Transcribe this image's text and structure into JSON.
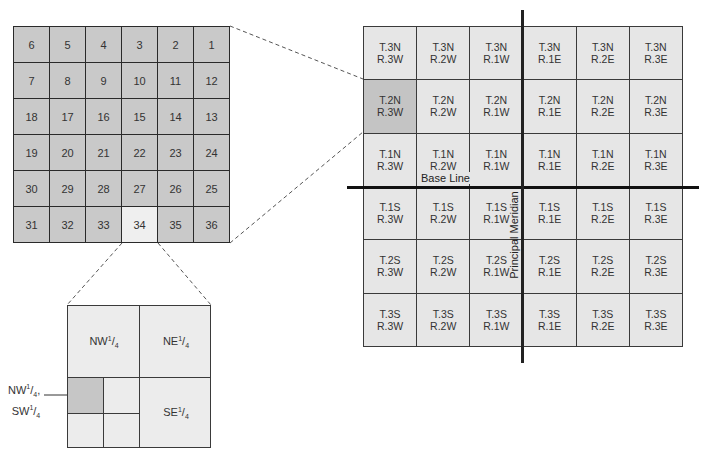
{
  "township": {
    "rows": [
      [
        "6",
        "5",
        "4",
        "3",
        "2",
        "1"
      ],
      [
        "7",
        "8",
        "9",
        "10",
        "11",
        "12"
      ],
      [
        "18",
        "17",
        "16",
        "15",
        "14",
        "13"
      ],
      [
        "19",
        "20",
        "21",
        "22",
        "23",
        "24"
      ],
      [
        "30",
        "29",
        "28",
        "27",
        "26",
        "25"
      ],
      [
        "31",
        "32",
        "33",
        "34",
        "35",
        "36"
      ]
    ],
    "highlighted_section": "34"
  },
  "section_detail": {
    "quarters": {
      "nw": {
        "base": "NW",
        "frac_num": "1",
        "frac_den": "4"
      },
      "ne": {
        "base": "NE",
        "frac_num": "1",
        "frac_den": "4"
      },
      "se": {
        "base": "SE",
        "frac_num": "1",
        "frac_den": "4"
      }
    },
    "callout": {
      "line1_base": "NW",
      "line1_suffix": ",",
      "line2_base": "SW",
      "frac_num": "1",
      "frac_den": "4"
    }
  },
  "survey_grid": {
    "rows": [
      [
        [
          "T.3N",
          "R.3W"
        ],
        [
          "T.3N",
          "R.2W"
        ],
        [
          "T.3N",
          "R.1W"
        ],
        [
          "T.3N",
          "R.1E"
        ],
        [
          "T.3N",
          "R.2E"
        ],
        [
          "T.3N",
          "R.3E"
        ]
      ],
      [
        [
          "T.2N",
          "R.3W"
        ],
        [
          "T.2N",
          "R.2W"
        ],
        [
          "T.2N",
          "R.1W"
        ],
        [
          "T.2N",
          "R.1E"
        ],
        [
          "T.2N",
          "R.2E"
        ],
        [
          "T.2N",
          "R.3E"
        ]
      ],
      [
        [
          "T.1N",
          "R.3W"
        ],
        [
          "T.1N",
          "R.2W"
        ],
        [
          "T.1N",
          "R.1W"
        ],
        [
          "T.1N",
          "R.1E"
        ],
        [
          "T.1N",
          "R.2E"
        ],
        [
          "T.1N",
          "R.3E"
        ]
      ],
      [
        [
          "T.1S",
          "R.3W"
        ],
        [
          "T.1S",
          "R.2W"
        ],
        [
          "T.1S",
          "R.1W"
        ],
        [
          "T.1S",
          "R.1E"
        ],
        [
          "T.1S",
          "R.2E"
        ],
        [
          "T.1S",
          "R.3E"
        ]
      ],
      [
        [
          "T.2S",
          "R.3W"
        ],
        [
          "T.2S",
          "R.2W"
        ],
        [
          "T.2S",
          "R.1W"
        ],
        [
          "T.2S",
          "R.1E"
        ],
        [
          "T.2S",
          "R.2E"
        ],
        [
          "T.2S",
          "R.3E"
        ]
      ],
      [
        [
          "T.3S",
          "R.3W"
        ],
        [
          "T.3S",
          "R.2W"
        ],
        [
          "T.3S",
          "R.1W"
        ],
        [
          "T.3S",
          "R.1E"
        ],
        [
          "T.3S",
          "R.2E"
        ],
        [
          "T.3S",
          "R.3E"
        ]
      ]
    ],
    "highlighted": "T.2N R.3W",
    "base_line_label": "Base Line",
    "principal_meridian_label": "Principal Meridian"
  },
  "colors": {
    "section_fill": "#c9c9c9",
    "highlight_section_fill": "#efefef",
    "township_fill": "#e6e6e6",
    "highlight_township_fill": "#c4c4c4",
    "lines": "#111111"
  }
}
